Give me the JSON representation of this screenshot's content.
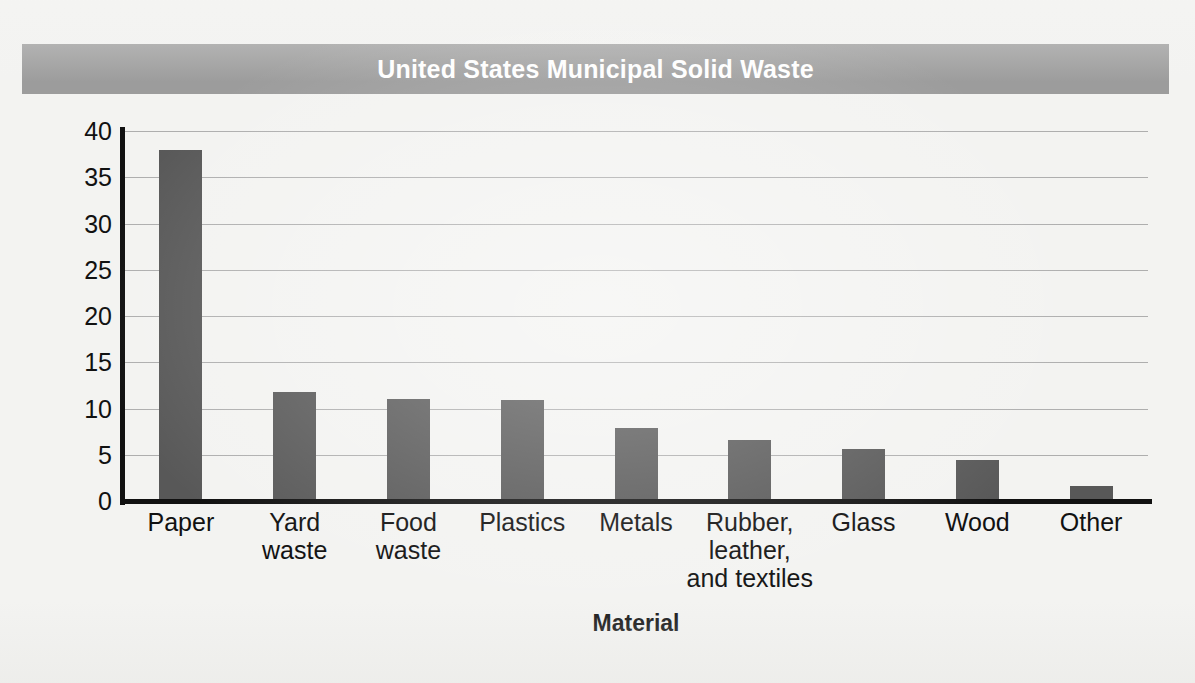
{
  "title": {
    "text": "United States Municipal Solid Waste",
    "banner_color": "#9c9c9c",
    "text_color": "#ffffff"
  },
  "chart_data": {
    "type": "bar",
    "title": "United States Municipal Solid Waste",
    "xlabel": "Material",
    "ylabel": "Total Waste (%)",
    "categories": [
      "Paper",
      "Yard\nwaste",
      "Food\nwaste",
      "Plastics",
      "Metals",
      "Rubber,\nleather,\nand textiles",
      "Glass",
      "Wood",
      "Other"
    ],
    "values": [
      38.0,
      11.8,
      11.0,
      10.9,
      7.9,
      6.6,
      5.6,
      4.4,
      1.6
    ],
    "ylim": [
      0,
      40
    ],
    "yticks": [
      0,
      5,
      10,
      15,
      20,
      25,
      30,
      35,
      40
    ],
    "ytick_labels": [
      "0",
      "5",
      "10",
      "15",
      "20",
      "25",
      "30",
      "35",
      "40"
    ],
    "grid": true,
    "grid_axis": "y",
    "legend": false,
    "bar_color": "#585858",
    "grid_color": "#aeaeae",
    "axis_color": "#111111"
  }
}
